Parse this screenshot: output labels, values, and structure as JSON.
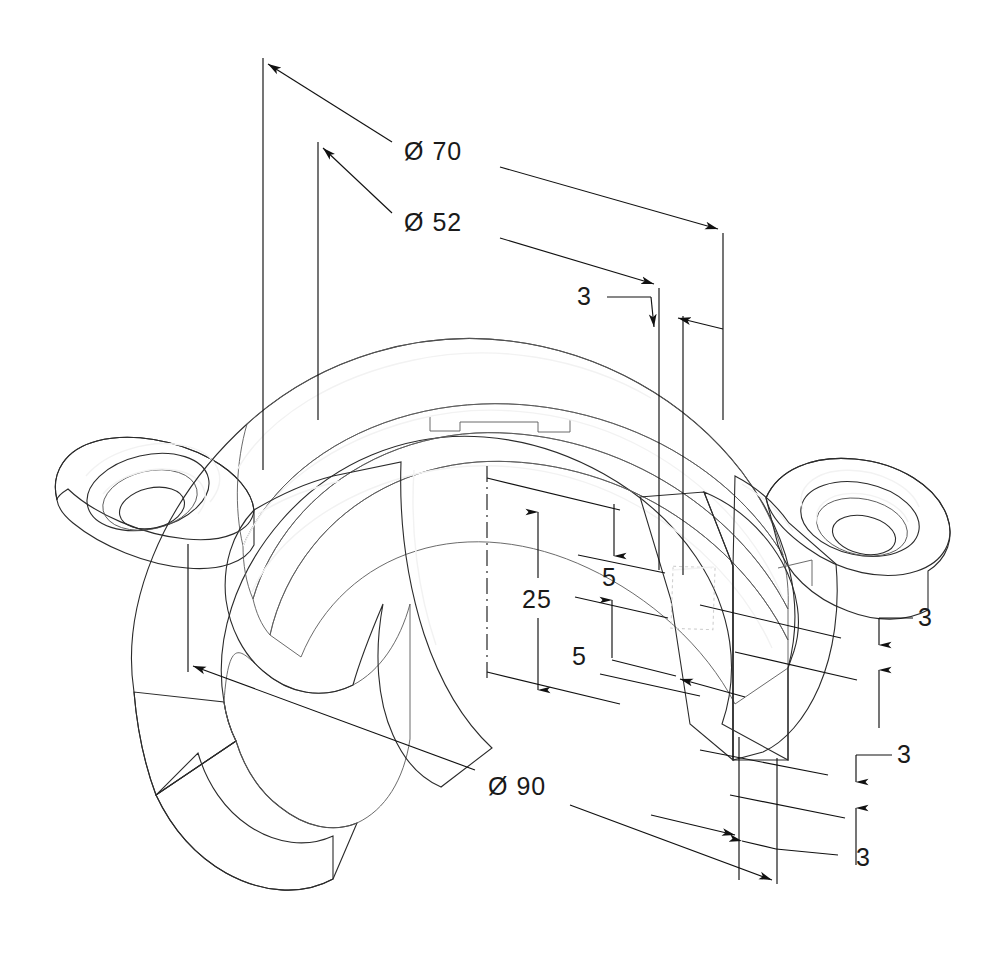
{
  "drawing": {
    "title": "Isometric sectioned bearing cap / saddle clamp",
    "background_color": "#ffffff",
    "line_color": "#111111",
    "text_color": "#1a1a1a",
    "units_note": "",
    "shading": {
      "outer_rim_top": "#868686",
      "ring_highlight": "#c9c9c9",
      "ring_mid": "#9a9a9a",
      "inner_bore": "#757575",
      "cut_face": "#8e8e8e",
      "flange_top": "#a6a6a6",
      "flange_side": "#7b7b7b",
      "counterbore_dark": "#6e6e6e",
      "counterbore_light": "#bdbdbd",
      "inner_cavity": "#9f9f9f",
      "shadow": "#6a6a6a"
    }
  },
  "dimensions": [
    {
      "id": "dia-70",
      "label": "Ø 70",
      "value": 70,
      "symbol": "diameter",
      "text_x": 404,
      "text_y": 160,
      "kind": "diameter-overall-outer"
    },
    {
      "id": "dia-52",
      "label": "Ø 52",
      "value": 52,
      "symbol": "diameter",
      "text_x": 404,
      "text_y": 231,
      "kind": "diameter-inner-bore"
    },
    {
      "id": "dia-90",
      "label": "Ø 90",
      "value": 90,
      "symbol": "diameter",
      "text_x": 490,
      "text_y": 795,
      "kind": "diameter-base-flange"
    },
    {
      "id": "height-25",
      "label": "25",
      "value": 25,
      "symbol": "linear",
      "text_x": 526,
      "text_y": 608,
      "kind": "vertical-height"
    },
    {
      "id": "height-5-upper",
      "label": "5",
      "value": 5,
      "symbol": "linear",
      "text_x": 608,
      "text_y": 583,
      "kind": "vertical-step"
    },
    {
      "id": "height-5-lower",
      "label": "5",
      "value": 5,
      "symbol": "linear",
      "text_x": 583,
      "text_y": 665,
      "kind": "vertical-step"
    },
    {
      "id": "thickness-3-top",
      "label": "3",
      "value": 3,
      "symbol": "linear",
      "text_x": 591,
      "text_y": 305,
      "kind": "wall-thickness"
    },
    {
      "id": "thickness-3-right-upper",
      "label": "3",
      "value": 3,
      "symbol": "linear",
      "text_x": 925,
      "text_y": 626,
      "kind": "wall-thickness"
    },
    {
      "id": "thickness-3-right-lower",
      "label": "3",
      "value": 3,
      "symbol": "linear",
      "text_x": 903,
      "text_y": 763,
      "kind": "wall-thickness"
    },
    {
      "id": "thickness-3-bottom",
      "label": "3",
      "value": 3,
      "symbol": "linear",
      "text_x": 869,
      "text_y": 866,
      "kind": "wall-thickness"
    }
  ]
}
